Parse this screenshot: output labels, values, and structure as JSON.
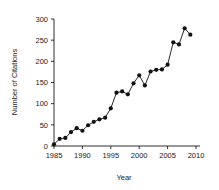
{
  "chart_data": {
    "type": "line",
    "title": "",
    "xlabel": "Year",
    "ylabel": "Number of Citations",
    "xlim": [
      1985,
      2010
    ],
    "ylim": [
      0,
      300
    ],
    "xticks": [
      1985,
      1990,
      1995,
      2000,
      2005,
      2010
    ],
    "yticks": [
      0,
      50,
      100,
      150,
      200,
      250,
      300
    ],
    "grid": false,
    "legend": null,
    "marker": "filled-circle",
    "line_color": "#111111",
    "marker_color": "#111111",
    "x": [
      1985,
      1986,
      1987,
      1988,
      1989,
      1990,
      1991,
      1992,
      1993,
      1994,
      1995,
      1996,
      1997,
      1998,
      1999,
      2000,
      2001,
      2002,
      2003,
      2004,
      2005,
      2006,
      2007,
      2008,
      2009
    ],
    "values": [
      4,
      17,
      19,
      33,
      42,
      36,
      49,
      57,
      63,
      67,
      89,
      126,
      129,
      122,
      148,
      167,
      143,
      176,
      180,
      181,
      192,
      245,
      240,
      278,
      263
    ],
    "series": [
      {
        "name": "Citations",
        "values": [
          4,
          17,
          19,
          33,
          42,
          36,
          49,
          57,
          63,
          67,
          89,
          126,
          129,
          122,
          148,
          167,
          143,
          176,
          180,
          181,
          192,
          245,
          240,
          278,
          263
        ]
      }
    ]
  }
}
